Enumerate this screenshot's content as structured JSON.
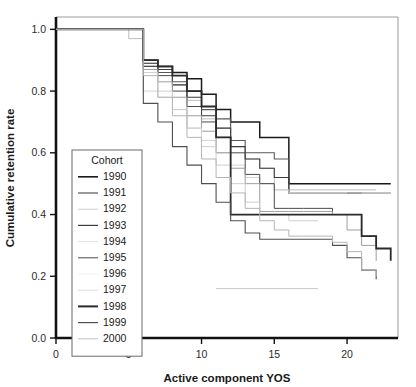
{
  "chart_data": {
    "type": "line",
    "subtype": "step-kaplan-meier",
    "title": "",
    "xlabel": "Active component YOS",
    "ylabel": "Cumulative retention rate",
    "xlim": [
      0,
      23.5
    ],
    "ylim": [
      0.0,
      1.04
    ],
    "xticks": [
      0,
      5,
      10,
      15,
      20
    ],
    "xtick_labels": [
      "0",
      "5",
      "10",
      "15",
      "20"
    ],
    "yticks": [
      0.0,
      0.2,
      0.4,
      0.6,
      0.8,
      1.0
    ],
    "ytick_labels": [
      "0.0",
      "0.2",
      "0.4",
      "0.6",
      "0.8",
      "1.0"
    ],
    "grid": false,
    "legend_position": "inner-left",
    "legend_title": "Cohort",
    "series": [
      {
        "name": "1990",
        "color": "#1a1a1a",
        "width": 1.5,
        "x": [
          0,
          5,
          6,
          7,
          8,
          9,
          10,
          11,
          12,
          13,
          14,
          15,
          16,
          17,
          18,
          19,
          20,
          21,
          22,
          23
        ],
        "y": [
          1.0,
          1.0,
          0.9,
          0.88,
          0.86,
          0.84,
          0.79,
          0.74,
          0.7,
          0.7,
          0.65,
          0.65,
          0.5,
          0.5,
          0.5,
          0.5,
          0.5,
          0.5,
          0.5,
          0.5
        ]
      },
      {
        "name": "1991",
        "color": "#595959",
        "width": 1.1,
        "x": [
          0,
          5,
          6,
          7,
          8,
          9,
          10,
          11,
          12,
          13,
          14,
          15,
          16,
          17,
          18,
          19,
          20,
          21,
          22,
          23
        ],
        "y": [
          1.0,
          1.0,
          0.88,
          0.86,
          0.83,
          0.8,
          0.74,
          0.71,
          0.64,
          0.6,
          0.6,
          0.58,
          0.47,
          0.47,
          0.47,
          0.47,
          0.47,
          0.47,
          0.47,
          0.47
        ]
      },
      {
        "name": "1992",
        "color": "#bdbdbd",
        "width": 1.0,
        "x": [
          0,
          4,
          5,
          6,
          7,
          8,
          9,
          10,
          11,
          12,
          13,
          14,
          15,
          16,
          17,
          18,
          19,
          20,
          21,
          22
        ],
        "y": [
          1.0,
          1.0,
          0.97,
          0.89,
          0.87,
          0.82,
          0.77,
          0.71,
          0.68,
          0.62,
          0.58,
          0.55,
          0.48,
          0.48,
          0.48,
          0.48,
          0.48,
          0.48,
          0.48,
          0.48
        ]
      },
      {
        "name": "1993",
        "color": "#3d3d3d",
        "width": 1.1,
        "x": [
          0,
          5,
          6,
          7,
          8,
          9,
          10,
          11,
          12,
          13,
          14,
          15,
          16,
          17,
          18,
          19,
          20,
          21
        ],
        "y": [
          1.0,
          1.0,
          0.89,
          0.87,
          0.82,
          0.78,
          0.72,
          0.68,
          0.62,
          0.58,
          0.55,
          0.52,
          0.47,
          0.47,
          0.47,
          0.47,
          0.47,
          0.47
        ]
      },
      {
        "name": "1994",
        "color": "#d4d4d4",
        "width": 1.0,
        "x": [
          0,
          5,
          6,
          7,
          8,
          9,
          10,
          11,
          12,
          13,
          14,
          15,
          16,
          17,
          18,
          19,
          20
        ],
        "y": [
          1.0,
          1.0,
          0.8,
          0.78,
          0.74,
          0.68,
          0.64,
          0.6,
          0.56,
          0.52,
          0.5,
          0.48,
          0.47,
          0.47,
          0.47,
          0.47,
          0.47
        ]
      },
      {
        "name": "1995",
        "color": "#4a4a4a",
        "width": 1.0,
        "x": [
          0,
          5,
          6,
          7,
          8,
          9,
          10,
          11,
          12,
          13,
          14,
          15,
          16,
          17,
          18,
          19,
          20,
          21,
          22
        ],
        "y": [
          1.0,
          1.0,
          0.88,
          0.85,
          0.8,
          0.75,
          0.7,
          0.65,
          0.6,
          0.53,
          0.5,
          0.42,
          0.42,
          0.42,
          0.42,
          0.4,
          0.4,
          0.33,
          0.3
        ]
      },
      {
        "name": "1996",
        "color": "#9e9e9e",
        "width": 1.0,
        "x": [
          0,
          5,
          6,
          7,
          8,
          9,
          10,
          11,
          12,
          13,
          14,
          15,
          16,
          17,
          18,
          19,
          20,
          21,
          22
        ],
        "y": [
          1.0,
          1.0,
          0.87,
          0.83,
          0.78,
          0.72,
          0.67,
          0.6,
          0.55,
          0.5,
          0.41,
          0.41,
          0.41,
          0.41,
          0.41,
          0.4,
          0.35,
          0.3,
          0.25
        ]
      },
      {
        "name": "1997",
        "color": "#cfcfcf",
        "width": 1.0,
        "x": [
          0,
          5,
          6,
          7,
          8,
          9,
          10,
          11,
          12,
          13,
          14,
          15,
          16,
          17,
          18
        ],
        "y": [
          1.0,
          1.0,
          0.86,
          0.8,
          0.74,
          0.68,
          0.62,
          0.56,
          0.5,
          0.44,
          0.4,
          0.4,
          0.38,
          0.38,
          0.38
        ]
      },
      {
        "name": "1998",
        "color": "#2b2b2b",
        "width": 1.8,
        "x": [
          0,
          5,
          6,
          7,
          8,
          9,
          10,
          11,
          12,
          13,
          14,
          15,
          16,
          17,
          18,
          19,
          20,
          21,
          22,
          23
        ],
        "y": [
          1.0,
          1.0,
          0.9,
          0.88,
          0.85,
          0.8,
          0.75,
          0.65,
          0.4,
          0.4,
          0.4,
          0.4,
          0.4,
          0.4,
          0.4,
          0.4,
          0.4,
          0.33,
          0.29,
          0.25
        ]
      },
      {
        "name": "1999",
        "color": "#4f4f4f",
        "width": 1.1,
        "x": [
          0,
          5,
          6,
          7,
          8,
          9,
          10,
          11,
          12,
          13,
          14,
          15,
          16,
          17,
          18,
          19,
          20,
          21,
          22
        ],
        "y": [
          1.0,
          1.0,
          0.76,
          0.7,
          0.62,
          0.56,
          0.5,
          0.44,
          0.38,
          0.34,
          0.32,
          0.32,
          0.32,
          0.32,
          0.32,
          0.3,
          0.26,
          0.22,
          0.19
        ]
      },
      {
        "name": "2000",
        "color": "#b5b5b5",
        "width": 1.0,
        "x": [
          0,
          5,
          6,
          7,
          8,
          9,
          10,
          11,
          12,
          13,
          14,
          15,
          16,
          17,
          18,
          19,
          20,
          21,
          22
        ],
        "y": [
          1.0,
          1.0,
          0.85,
          0.78,
          0.72,
          0.65,
          0.58,
          0.52,
          0.47,
          0.42,
          0.38,
          0.35,
          0.33,
          0.33,
          0.33,
          0.31,
          0.28,
          0.22,
          0.2
        ]
      }
    ],
    "censored_tails": [
      {
        "name": "1992-tail",
        "color": "#c9c9c9",
        "width": 1.0,
        "y": 0.16,
        "x_start": 11,
        "x_end": 18
      },
      {
        "name": "1994-tail",
        "color": "#d4d4d4",
        "width": 1.0,
        "y": 0.47,
        "x_start": 16,
        "x_end": 23
      }
    ]
  },
  "legend": {
    "title": "Cohort",
    "entries": [
      {
        "label": "1990",
        "color": "#1a1a1a",
        "width": 1.6
      },
      {
        "label": "1991",
        "color": "#595959",
        "width": 1.2
      },
      {
        "label": "1992",
        "color": "#cdcdcd",
        "width": 1.0
      },
      {
        "label": "1993",
        "color": "#3d3d3d",
        "width": 1.2
      },
      {
        "label": "1994",
        "color": "#e2e2e2",
        "width": 1.0
      },
      {
        "label": "1995",
        "color": "#4a4a4a",
        "width": 1.0
      },
      {
        "label": "1996",
        "color": "#f2f2f2",
        "width": 1.0
      },
      {
        "label": "1997",
        "color": "#dcdcdc",
        "width": 1.0
      },
      {
        "label": "1998",
        "color": "#2b2b2b",
        "width": 2.0
      },
      {
        "label": "1999",
        "color": "#4f4f4f",
        "width": 1.2
      },
      {
        "label": "2000",
        "color": "#c2c2c2",
        "width": 1.0
      }
    ]
  },
  "axes": {
    "x_title": "Active component YOS",
    "y_title": "Cumulative retention rate"
  }
}
